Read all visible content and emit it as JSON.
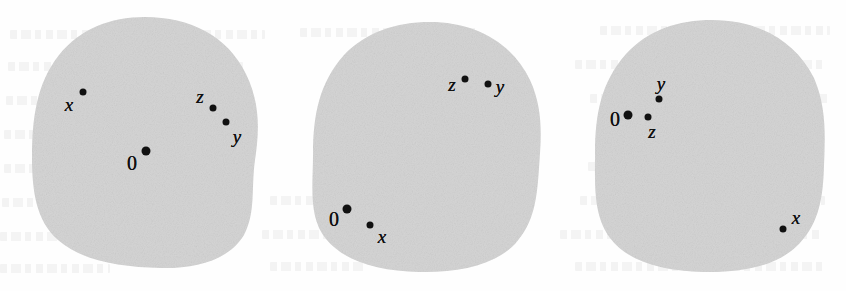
{
  "figure": {
    "caption": "",
    "width": 846,
    "height": 291,
    "background_color": "#fefefe",
    "blob_fill_color": "#d5d5d5",
    "marker_color": "#111111"
  },
  "blobs": [
    {
      "name": "blob-left",
      "index": 1,
      "center": {
        "x": 145,
        "y": 142
      },
      "radius_x": 113,
      "radius_y": 126,
      "points": [
        {
          "id": "origin",
          "label": "0",
          "label_style": "upright",
          "marker_size": "big",
          "marker": {
            "x": 146,
            "y": 151
          },
          "label_pos": {
            "x": 132,
            "y": 163
          }
        },
        {
          "id": "x",
          "label": "x",
          "label_style": "italic",
          "marker_size": "small",
          "marker": {
            "x": 83,
            "y": 92
          },
          "label_pos": {
            "x": 69,
            "y": 104
          }
        },
        {
          "id": "z",
          "label": "z",
          "label_style": "italic",
          "marker_size": "small",
          "marker": {
            "x": 213,
            "y": 108
          },
          "label_pos": {
            "x": 200,
            "y": 96
          }
        },
        {
          "id": "y",
          "label": "y",
          "label_style": "italic",
          "marker_size": "small",
          "marker": {
            "x": 226,
            "y": 122
          },
          "label_pos": {
            "x": 237,
            "y": 136
          }
        }
      ]
    },
    {
      "name": "blob-middle",
      "index": 2,
      "center": {
        "x": 427,
        "y": 146
      },
      "radius_x": 114,
      "radius_y": 125,
      "points": [
        {
          "id": "origin",
          "label": "0",
          "label_style": "upright",
          "marker_size": "big",
          "marker": {
            "x": 347,
            "y": 209
          },
          "label_pos": {
            "x": 334,
            "y": 219
          }
        },
        {
          "id": "x",
          "label": "x",
          "label_style": "italic",
          "marker_size": "small",
          "marker": {
            "x": 370,
            "y": 225
          },
          "label_pos": {
            "x": 382,
            "y": 236
          }
        },
        {
          "id": "z",
          "label": "z",
          "label_style": "italic",
          "marker_size": "small",
          "marker": {
            "x": 465,
            "y": 79
          },
          "label_pos": {
            "x": 452,
            "y": 84
          }
        },
        {
          "id": "y",
          "label": "y",
          "label_style": "italic",
          "marker_size": "small",
          "marker": {
            "x": 488,
            "y": 84
          },
          "label_pos": {
            "x": 500,
            "y": 86
          }
        }
      ]
    },
    {
      "name": "blob-right",
      "index": 3,
      "center": {
        "x": 710,
        "y": 146
      },
      "radius_x": 115,
      "radius_y": 126,
      "points": [
        {
          "id": "origin",
          "label": "0",
          "label_style": "upright",
          "marker_size": "big",
          "marker": {
            "x": 628,
            "y": 115
          },
          "label_pos": {
            "x": 615,
            "y": 119
          }
        },
        {
          "id": "z",
          "label": "z",
          "label_style": "italic",
          "marker_size": "small",
          "marker": {
            "x": 648,
            "y": 117
          },
          "label_pos": {
            "x": 652,
            "y": 131
          }
        },
        {
          "id": "y",
          "label": "y",
          "label_style": "italic",
          "marker_size": "small",
          "marker": {
            "x": 659,
            "y": 99
          },
          "label_pos": {
            "x": 661,
            "y": 83
          }
        },
        {
          "id": "x",
          "label": "x",
          "label_style": "italic",
          "marker_size": "small",
          "marker": {
            "x": 783,
            "y": 229
          },
          "label_pos": {
            "x": 796,
            "y": 217
          }
        }
      ]
    }
  ],
  "background_ghost_lines": [
    {
      "x": 10,
      "y": 30,
      "w": 255
    },
    {
      "x": 300,
      "y": 28,
      "w": 180
    },
    {
      "x": 600,
      "y": 26,
      "w": 230
    },
    {
      "x": 8,
      "y": 62,
      "w": 235
    },
    {
      "x": 575,
      "y": 60,
      "w": 250
    },
    {
      "x": 6,
      "y": 96,
      "w": 70
    },
    {
      "x": 590,
      "y": 94,
      "w": 240
    },
    {
      "x": 4,
      "y": 130,
      "w": 55
    },
    {
      "x": 600,
      "y": 128,
      "w": 225
    },
    {
      "x": 4,
      "y": 164,
      "w": 45
    },
    {
      "x": 588,
      "y": 162,
      "w": 235
    },
    {
      "x": 2,
      "y": 198,
      "w": 60
    },
    {
      "x": 270,
      "y": 196,
      "w": 70
    },
    {
      "x": 580,
      "y": 196,
      "w": 245
    },
    {
      "x": 0,
      "y": 232,
      "w": 80
    },
    {
      "x": 262,
      "y": 230,
      "w": 90
    },
    {
      "x": 560,
      "y": 230,
      "w": 260
    },
    {
      "x": 0,
      "y": 264,
      "w": 110
    },
    {
      "x": 270,
      "y": 262,
      "w": 95
    },
    {
      "x": 575,
      "y": 262,
      "w": 250
    }
  ]
}
